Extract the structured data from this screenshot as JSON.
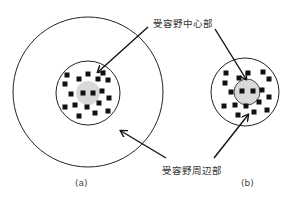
{
  "labels": {
    "center": "受容野中心部",
    "surround": "受容野周辺部"
  },
  "captions": {
    "a": "(a)",
    "b": "(b)"
  },
  "colors": {
    "line": "#222222",
    "center_fill": "#d9d9d9",
    "dot": "#111111"
  },
  "panels": [
    {
      "id": "a",
      "outer_circle": {
        "cx": 88,
        "cy": 92,
        "r": 75
      },
      "inner_circle": {
        "cx": 88,
        "cy": 93,
        "r": 32
      },
      "center_region": {
        "cx": 88,
        "cy": 93,
        "r": 12
      },
      "dots": [
        [
          67,
          75
        ],
        [
          88,
          74
        ],
        [
          103,
          73
        ],
        [
          65,
          84
        ],
        [
          79,
          79
        ],
        [
          98,
          79
        ],
        [
          108,
          80
        ],
        [
          71,
          94
        ],
        [
          83,
          93
        ],
        [
          93,
          93
        ],
        [
          102,
          91
        ],
        [
          109,
          98
        ],
        [
          65,
          107
        ],
        [
          75,
          105
        ],
        [
          87,
          107
        ],
        [
          99,
          103
        ],
        [
          108,
          111
        ],
        [
          79,
          116
        ],
        [
          95,
          113
        ]
      ]
    },
    {
      "id": "b",
      "outer_circle": {
        "cx": 245,
        "cy": 92,
        "r": 34
      },
      "center_region": {
        "cx": 247,
        "cy": 92,
        "r": 13
      },
      "dots": [
        [
          226,
          73
        ],
        [
          239,
          78
        ],
        [
          248,
          73
        ],
        [
          263,
          72
        ],
        [
          269,
          79
        ],
        [
          225,
          83
        ],
        [
          231,
          92
        ],
        [
          242,
          91
        ],
        [
          253,
          91
        ],
        [
          262,
          90
        ],
        [
          269,
          97
        ],
        [
          224,
          106
        ],
        [
          235,
          105
        ],
        [
          246,
          106
        ],
        [
          259,
          102
        ],
        [
          267,
          110
        ],
        [
          238,
          115
        ],
        [
          254,
          112
        ]
      ]
    }
  ],
  "arrows": [
    {
      "target": "center-a",
      "x1": 148,
      "y1": 27,
      "x2": 98,
      "y2": 72
    },
    {
      "target": "center-b",
      "x1": 215,
      "y1": 29,
      "x2": 246,
      "y2": 79
    },
    {
      "target": "surround-a",
      "x1": 166,
      "y1": 158,
      "x2": 121,
      "y2": 131
    },
    {
      "target": "surround-b",
      "x1": 214,
      "y1": 158,
      "x2": 248,
      "y2": 115
    }
  ]
}
